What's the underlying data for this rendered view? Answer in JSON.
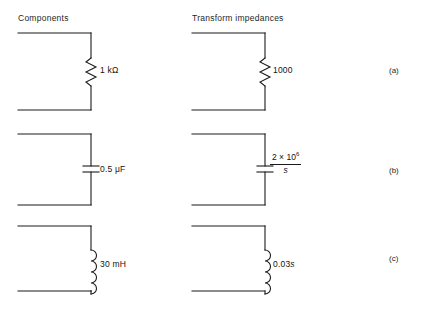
{
  "figure": {
    "background": "#ffffff",
    "line_color": "#1a1a1a",
    "headers": {
      "left": "Components",
      "right": "Transform impedances"
    },
    "row_labels": {
      "a": "(a)",
      "b": "(b)",
      "c": "(c)"
    },
    "rows": [
      {
        "id": "a",
        "symbol": "resistor",
        "component_label": "1 kΩ",
        "impedance_label": "1000"
      },
      {
        "id": "b",
        "symbol": "capacitor",
        "component_label": "0.5 μF",
        "impedance_numerator": "2 × 10",
        "impedance_exponent": "6",
        "impedance_denominator": "s"
      },
      {
        "id": "c",
        "symbol": "inductor",
        "component_label": "30 mH",
        "impedance_label": "0.03",
        "impedance_label_var": "s"
      }
    ]
  }
}
